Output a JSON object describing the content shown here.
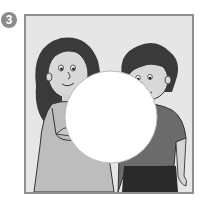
{
  "exercise": {
    "number": "3"
  },
  "illustration": {
    "description": "Girl and boy looking at a blank white circle",
    "colors": {
      "background": "#e6e6e6",
      "frame": "#8f8f8f",
      "badge": "#8a8a8a",
      "hair": "#3a3a3a",
      "skin": "#d4d4d4",
      "girl_dress": "#bdbdbd",
      "boy_shirt": "#6b6b6b",
      "boy_pants": "#2a2a2a",
      "circle": "#ffffff"
    }
  }
}
